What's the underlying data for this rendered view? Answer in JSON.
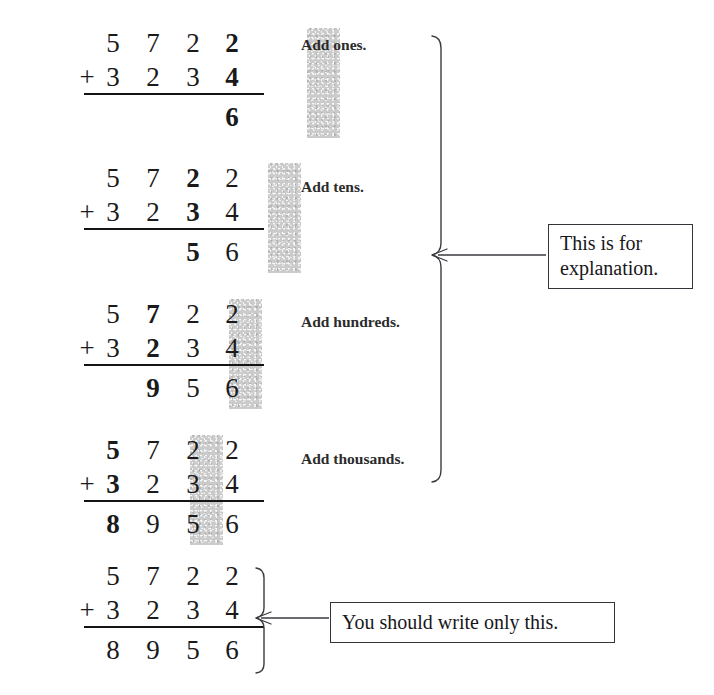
{
  "problem": {
    "addend1": [
      "5",
      "7",
      "2",
      "2"
    ],
    "addend2": [
      "3",
      "2",
      "3",
      "4"
    ],
    "sum": [
      "8",
      "9",
      "5",
      "6"
    ],
    "operator": "+"
  },
  "steps": [
    {
      "label": "Add ones.",
      "highlight_column": 3,
      "top": [
        "5",
        "7",
        "2",
        "2"
      ],
      "bottom": [
        "3",
        "2",
        "3",
        "4"
      ],
      "result": [
        "",
        "",
        "",
        "6"
      ]
    },
    {
      "label": "Add tens.",
      "highlight_column": 2,
      "top": [
        "5",
        "7",
        "2",
        "2"
      ],
      "bottom": [
        "3",
        "2",
        "3",
        "4"
      ],
      "result": [
        "",
        "",
        "5",
        "6"
      ]
    },
    {
      "label": "Add hundreds.",
      "highlight_column": 1,
      "top": [
        "5",
        "7",
        "2",
        "2"
      ],
      "bottom": [
        "3",
        "2",
        "3",
        "4"
      ],
      "result": [
        "",
        "9",
        "5",
        "6"
      ]
    },
    {
      "label": "Add thousands.",
      "highlight_column": 0,
      "top": [
        "5",
        "7",
        "2",
        "2"
      ],
      "bottom": [
        "3",
        "2",
        "3",
        "4"
      ],
      "result": [
        "8",
        "9",
        "5",
        "6"
      ]
    },
    {
      "label": "",
      "highlight_column": -1,
      "top": [
        "5",
        "7",
        "2",
        "2"
      ],
      "bottom": [
        "3",
        "2",
        "3",
        "4"
      ],
      "result": [
        "8",
        "9",
        "5",
        "6"
      ]
    }
  ],
  "callouts": {
    "explanation": "This is for explanation.",
    "explanation_line1": "This is for",
    "explanation_line2": "explanation.",
    "final": "You should write only this."
  },
  "colors": {
    "ink": "#1a1a1a",
    "highlight": "#c9c9c9",
    "box_border": "#33333a",
    "page_background": "#ffffff"
  }
}
